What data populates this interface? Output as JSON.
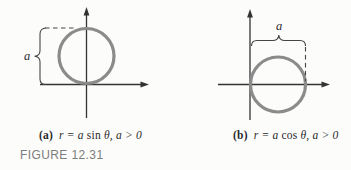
{
  "figure": {
    "caption": "FIGURE 12.31",
    "colors": {
      "circle": "#8b8b8b",
      "axis": "#333333",
      "annotation": "#454545",
      "caption_text": "#7c7c7c",
      "equation_text": "#2b2b2b",
      "background": "#fcfcfb"
    },
    "panels": [
      {
        "label": "(a)",
        "eq_open": "r = a ",
        "eq_fn": "sin",
        "eq_close": " θ, a > 0",
        "radius_label": "a"
      },
      {
        "label": "(b)",
        "eq_open": "r = a ",
        "eq_fn": "cos",
        "eq_close": " θ, a > 0",
        "radius_label": "a"
      }
    ]
  }
}
